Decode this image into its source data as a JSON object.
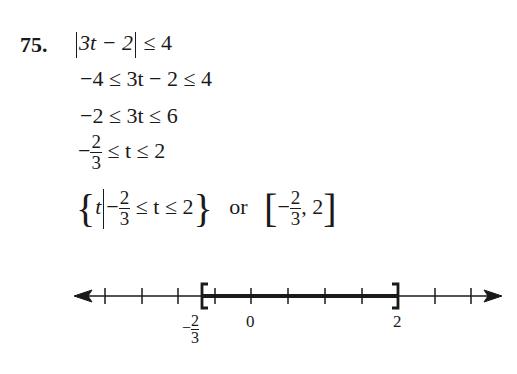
{
  "problem": {
    "number": "75.",
    "lines": {
      "l1": {
        "abs_inner": "3t − 2",
        "rest": "≤ 4"
      },
      "l2": "−4 ≤ 3t − 2 ≤ 4",
      "l3": "−2 ≤ 3t ≤ 6",
      "l4": {
        "neg": "−",
        "frac_num": "2",
        "frac_den": "3",
        "rest": "≤ t ≤ 2"
      },
      "l5": {
        "open": "{",
        "var": "t",
        "neg": "−",
        "frac_num": "2",
        "frac_den": "3",
        "rest": "≤ t ≤ 2",
        "close": "}",
        "or": "or",
        "interval_open": "[",
        "int_neg": "−",
        "int_num": "2",
        "int_den": "3",
        "int_rest": ", 2",
        "interval_close": "]"
      }
    },
    "number_line": {
      "labels": {
        "neg_two_thirds": {
          "neg": "−",
          "num": "2",
          "den": "3"
        },
        "zero": "0",
        "two": "2"
      },
      "tick_step": 0.5,
      "range": [
        -2,
        3
      ],
      "closed_interval": [
        -0.6667,
        2
      ]
    }
  }
}
